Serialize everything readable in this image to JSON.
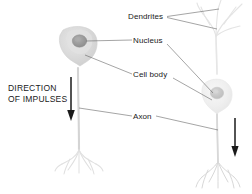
{
  "diagram": {
    "background_color": "#ffffff",
    "labels": {
      "dendrites": "Dendrites",
      "nucleus": "Nucleus",
      "cell_body": "Cell body",
      "axon": "Axon",
      "direction_line1": "DIRECTION",
      "direction_line2": "OF IMPULSES"
    },
    "colors": {
      "label_text": "#1a1a1a",
      "leader_line": "#4a4a4a",
      "arrow": "#1a1a1a",
      "cell_body_fill_left": "#dcdcdc",
      "cell_body_fill_right": "#f0f0f0",
      "nucleus_fill_left": "#9c9c9c",
      "nucleus_fill_right": "#c8c8c8",
      "axon_stroke": "#d2d2d2",
      "dendrite_stroke": "#e2e2e2"
    },
    "parts": [
      {
        "name": "dendrites",
        "label": "Dendrites",
        "leader_count": 2
      },
      {
        "name": "nucleus",
        "label": "Nucleus",
        "leader_count": 2
      },
      {
        "name": "cell-body",
        "label": "Cell body",
        "leader_count": 2
      },
      {
        "name": "axon",
        "label": "Axon",
        "leader_count": 2
      }
    ],
    "neurons": [
      {
        "name": "left-neuron",
        "soma_x": 78,
        "soma_y": 47,
        "arrow": "down"
      },
      {
        "name": "right-neuron",
        "soma_x": 216,
        "soma_y": 93,
        "arrow": "down"
      }
    ]
  }
}
